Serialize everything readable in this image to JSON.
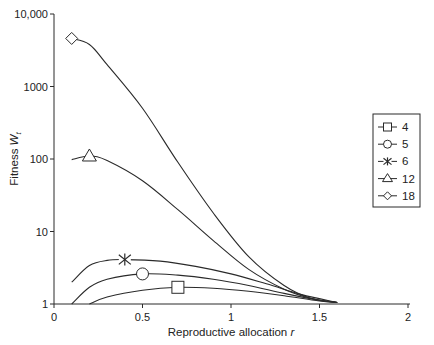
{
  "chart_data": {
    "type": "line",
    "title": "",
    "xlabel": "Reproductive allocation r",
    "ylabel": "Fitness W_t",
    "xlim": [
      0,
      2
    ],
    "ylim": [
      1,
      10000
    ],
    "yscale": "log",
    "x_ticks": [
      "0",
      "0.5",
      "1",
      "1.5",
      "2"
    ],
    "y_ticks": [
      "1",
      "10",
      "100",
      "1000",
      "10,000"
    ],
    "grid": false,
    "legend_position": "right",
    "series": [
      {
        "name": "4",
        "marker": "square",
        "marker_at": [
          0.7,
          1.7
        ],
        "points": [
          [
            0.2,
            1.0
          ],
          [
            0.3,
            1.25
          ],
          [
            0.5,
            1.55
          ],
          [
            0.7,
            1.7
          ],
          [
            0.9,
            1.65
          ],
          [
            1.1,
            1.5
          ],
          [
            1.3,
            1.3
          ],
          [
            1.5,
            1.1
          ],
          [
            1.6,
            1.05
          ]
        ]
      },
      {
        "name": "5",
        "marker": "circle",
        "marker_at": [
          0.5,
          2.6
        ],
        "points": [
          [
            0.1,
            1.0
          ],
          [
            0.2,
            1.7
          ],
          [
            0.3,
            2.2
          ],
          [
            0.5,
            2.6
          ],
          [
            0.7,
            2.5
          ],
          [
            0.9,
            2.2
          ],
          [
            1.1,
            1.8
          ],
          [
            1.3,
            1.4
          ],
          [
            1.5,
            1.12
          ],
          [
            1.6,
            1.05
          ]
        ]
      },
      {
        "name": "6",
        "marker": "asterisk",
        "marker_at": [
          0.4,
          4.1
        ],
        "points": [
          [
            0.1,
            2.0
          ],
          [
            0.2,
            3.4
          ],
          [
            0.3,
            4.0
          ],
          [
            0.4,
            4.1
          ],
          [
            0.6,
            3.9
          ],
          [
            0.8,
            3.3
          ],
          [
            1.0,
            2.6
          ],
          [
            1.2,
            1.9
          ],
          [
            1.4,
            1.35
          ],
          [
            1.6,
            1.05
          ]
        ]
      },
      {
        "name": "12",
        "marker": "triangle",
        "marker_at": [
          0.2,
          110
        ],
        "points": [
          [
            0.1,
            98
          ],
          [
            0.2,
            110
          ],
          [
            0.3,
            95
          ],
          [
            0.5,
            50
          ],
          [
            0.7,
            20
          ],
          [
            0.9,
            7.5
          ],
          [
            1.1,
            3.0
          ],
          [
            1.3,
            1.6
          ],
          [
            1.45,
            1.2
          ],
          [
            1.6,
            1.05
          ]
        ]
      },
      {
        "name": "18",
        "marker": "diamond",
        "marker_at": [
          0.1,
          4600
        ],
        "points": [
          [
            0.1,
            4600
          ],
          [
            0.2,
            3800
          ],
          [
            0.3,
            2000
          ],
          [
            0.5,
            500
          ],
          [
            0.7,
            90
          ],
          [
            0.9,
            18
          ],
          [
            1.1,
            4.5
          ],
          [
            1.3,
            1.8
          ],
          [
            1.45,
            1.2
          ],
          [
            1.6,
            1.05
          ]
        ]
      }
    ]
  },
  "axes": {
    "x_title_main": "Reproductive allocation ",
    "x_title_var": "r",
    "y_title_main": "Fitness ",
    "y_title_var": "W",
    "y_title_sub": "t"
  }
}
